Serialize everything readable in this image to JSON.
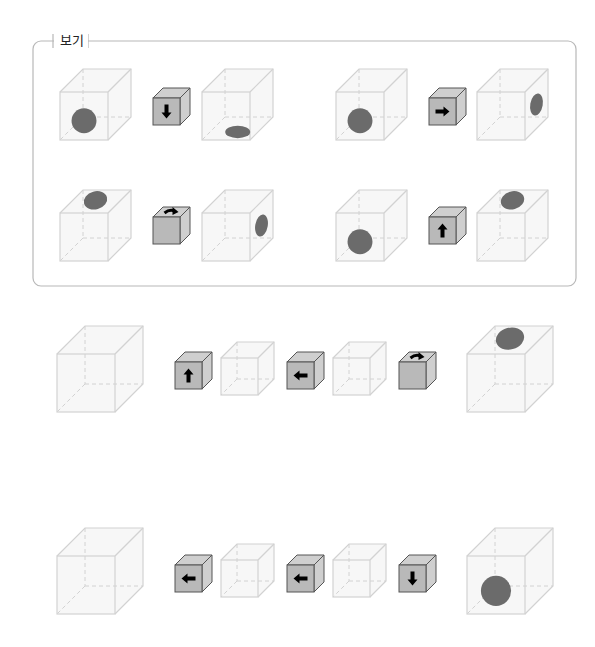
{
  "legend": {
    "label": "보기",
    "box": {
      "x": 33,
      "y": 41,
      "w": 543,
      "h": 245,
      "radius": 8,
      "stroke": "#b8b8b8"
    }
  },
  "colors": {
    "cube_edge": "#d2d2d2",
    "cube_face": "#f7f7f7",
    "dot": "#6b6b6b",
    "op_face": "#b9b9b9",
    "op_side": "#cfcfcf",
    "op_edge": "#555555",
    "arrow": "#000000"
  },
  "examples": [
    {
      "before": {
        "x": 60,
        "y": 92,
        "s": 48,
        "d": 23,
        "dot": "front"
      },
      "op": {
        "x": 153,
        "y": 98,
        "dir": "down"
      },
      "after": {
        "x": 202,
        "y": 92,
        "s": 48,
        "d": 23,
        "dot": "bottom"
      }
    },
    {
      "before": {
        "x": 336,
        "y": 92,
        "s": 48,
        "d": 23,
        "dot": "front"
      },
      "op": {
        "x": 429,
        "y": 98,
        "dir": "right"
      },
      "after": {
        "x": 477,
        "y": 92,
        "s": 48,
        "d": 23,
        "dot": "right"
      }
    },
    {
      "before": {
        "x": 60,
        "y": 213,
        "s": 48,
        "d": 23,
        "dot": "top"
      },
      "op": {
        "x": 153,
        "y": 217,
        "dir": "rotate"
      },
      "after": {
        "x": 202,
        "y": 213,
        "s": 48,
        "d": 23,
        "dot": "right"
      }
    },
    {
      "before": {
        "x": 336,
        "y": 213,
        "s": 48,
        "d": 23,
        "dot": "front"
      },
      "op": {
        "x": 429,
        "y": 217,
        "dir": "up"
      },
      "after": {
        "x": 477,
        "y": 213,
        "s": 48,
        "d": 23,
        "dot": "top"
      }
    }
  ],
  "problems": [
    {
      "start": {
        "x": 57,
        "y": 354,
        "s": 58,
        "d": 28,
        "dot": "none"
      },
      "steps": [
        {
          "op": {
            "x": 175,
            "y": 362,
            "dir": "up"
          },
          "mid": {
            "x": 221,
            "y": 358,
            "s": 37,
            "d": 16,
            "dot": "none"
          }
        },
        {
          "op": {
            "x": 287,
            "y": 362,
            "dir": "left"
          },
          "mid": {
            "x": 333,
            "y": 358,
            "s": 37,
            "d": 16,
            "dot": "none"
          }
        },
        {
          "op": {
            "x": 399,
            "y": 362,
            "dir": "rotate"
          }
        }
      ],
      "result": {
        "x": 467,
        "y": 354,
        "s": 58,
        "d": 28,
        "dot": "top"
      }
    },
    {
      "start": {
        "x": 57,
        "y": 556,
        "s": 58,
        "d": 28,
        "dot": "none"
      },
      "steps": [
        {
          "op": {
            "x": 175,
            "y": 565,
            "dir": "left"
          },
          "mid": {
            "x": 221,
            "y": 560,
            "s": 37,
            "d": 16,
            "dot": "none"
          }
        },
        {
          "op": {
            "x": 287,
            "y": 565,
            "dir": "left"
          },
          "mid": {
            "x": 333,
            "y": 560,
            "s": 37,
            "d": 16,
            "dot": "none"
          }
        },
        {
          "op": {
            "x": 399,
            "y": 565,
            "dir": "down"
          }
        }
      ],
      "result": {
        "x": 467,
        "y": 556,
        "s": 58,
        "d": 28,
        "dot": "front"
      }
    }
  ]
}
